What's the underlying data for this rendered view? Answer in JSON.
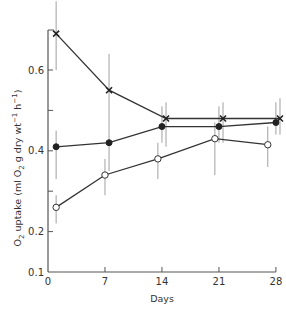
{
  "chart_data": {
    "type": "line",
    "title": "",
    "xlabel": "Days",
    "ylabel": "O2 uptake (ml O2 g dry wt-1 h-1)",
    "ylabel_parts": {
      "pre": "O",
      "sub1": "2",
      "mid": " uptake (ml O",
      "sub2": "2",
      "mid2": " g dry wt",
      "sup1": "−1",
      "mid3": " h",
      "sup2": "−1",
      "post": ")"
    },
    "xlim": [
      0,
      28.5
    ],
    "ylim": [
      0.1,
      0.7
    ],
    "xticks": [
      0,
      7,
      14,
      21,
      28
    ],
    "xtick_labels": [
      "0",
      "7",
      "14",
      "21",
      "28"
    ],
    "yticks": [
      0.1,
      0.2,
      0.3,
      0.4,
      0.5,
      0.6
    ],
    "ytick_labels": [
      "0.1",
      "0.2",
      "",
      "0.4",
      "",
      "0.6"
    ],
    "grid": false,
    "legend": null,
    "series": [
      {
        "name": "cross-marker series",
        "marker": "x",
        "x": [
          1,
          7.5,
          14.5,
          21.5,
          28.5
        ],
        "values": [
          0.69,
          0.55,
          0.48,
          0.48,
          0.48
        ],
        "err_low": [
          0.6,
          0.45,
          0.41,
          0.42,
          0.44
        ],
        "err_high": [
          0.77,
          0.64,
          0.52,
          0.52,
          0.53
        ]
      },
      {
        "name": "filled-circle series",
        "marker": "filled-circle",
        "x": [
          1,
          7.5,
          14,
          21,
          28
        ],
        "values": [
          0.41,
          0.42,
          0.46,
          0.46,
          0.47
        ],
        "err_low": [
          0.33,
          0.35,
          0.42,
          0.42,
          0.44
        ],
        "err_high": [
          0.45,
          0.45,
          0.51,
          0.51,
          0.52
        ]
      },
      {
        "name": "open-circle series",
        "marker": "open-circle",
        "x": [
          1,
          7,
          13.5,
          20.5,
          27
        ],
        "values": [
          0.26,
          0.34,
          0.38,
          0.43,
          0.415
        ],
        "err_low": [
          0.22,
          0.29,
          0.33,
          0.34,
          0.36
        ],
        "err_high": [
          0.29,
          0.38,
          0.42,
          0.47,
          0.46
        ]
      }
    ]
  }
}
